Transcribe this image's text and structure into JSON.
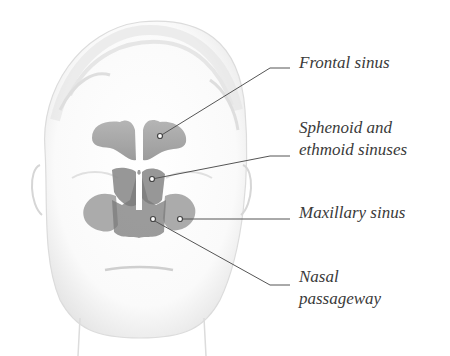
{
  "diagram": {
    "colors": {
      "background": "#ffffff",
      "face_line": "#d2d2d2",
      "face_shade": "#ececec",
      "sinus_fill": "#9a9a9a",
      "sinus_dark": "#6e6e6e",
      "leader_line": "#555555",
      "label_text": "#3a3a3a"
    },
    "labels": [
      {
        "id": "frontal",
        "lines": [
          "Frontal sinus"
        ]
      },
      {
        "id": "sphenoid-ethmoid",
        "lines": [
          "Sphenoid and",
          "ethmoid sinuses"
        ]
      },
      {
        "id": "maxillary",
        "lines": [
          "Maxillary sinus"
        ]
      },
      {
        "id": "nasal",
        "lines": [
          "Nasal",
          "passageway"
        ]
      }
    ]
  }
}
